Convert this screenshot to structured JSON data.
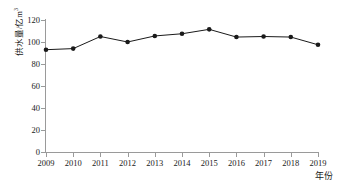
{
  "chart_data": {
    "type": "line",
    "title": "",
    "subtitle": "",
    "xlabel": "年份",
    "ylabel": "供水量/亿m³",
    "ylabel_base": "供水量/亿m",
    "ylabel_sup": "3",
    "categories": [
      "2009",
      "2010",
      "2011",
      "2012",
      "2013",
      "2014",
      "2015",
      "2016",
      "2017",
      "2018",
      "2019"
    ],
    "x": [
      2009,
      2010,
      2011,
      2012,
      2013,
      2014,
      2015,
      2016,
      2017,
      2018,
      2019
    ],
    "values": [
      93,
      94,
      105,
      100,
      105.5,
      107.5,
      111.5,
      104.5,
      105,
      104.5,
      97.5
    ],
    "series": [
      {
        "name": "供水量",
        "values": [
          93,
          94,
          105,
          100,
          105.5,
          107.5,
          111.5,
          104.5,
          105,
          104.5,
          97.5
        ]
      }
    ],
    "ylim": [
      0,
      120
    ],
    "yticks": [
      0,
      20,
      40,
      60,
      80,
      100,
      120
    ],
    "ytick_labels": [
      "0",
      "20",
      "40",
      "60",
      "80",
      "100",
      "120"
    ],
    "xlim": [
      2009,
      2019
    ],
    "grid": false,
    "legend": false,
    "legend_position": "none",
    "marker": "filled-circle",
    "line_color": "#1a1a1a",
    "marker_color": "#1a1a1a",
    "axis_color": "#9a9a9a",
    "background_color": "#ffffff"
  }
}
